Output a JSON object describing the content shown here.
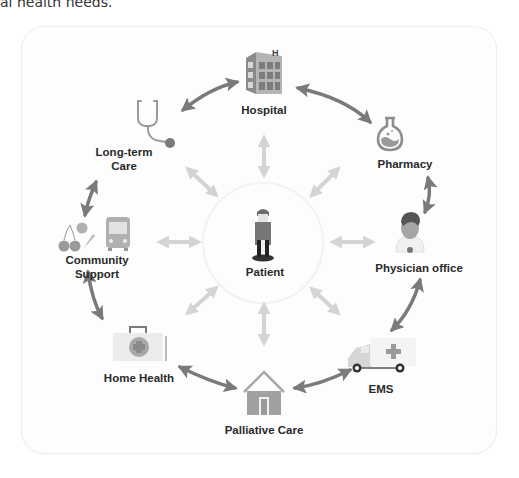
{
  "intro": {
    "text": "al health needs."
  },
  "diagram": {
    "center": {
      "label": "Patient",
      "icon": "patient-icon"
    },
    "nodes": [
      {
        "id": "hospital",
        "label": "Hospital",
        "icon": "hospital-building-icon"
      },
      {
        "id": "pharmacy",
        "label": "Pharmacy",
        "icon": "flask-icon"
      },
      {
        "id": "physician",
        "label": "Physician office",
        "icon": "doctor-icon"
      },
      {
        "id": "ems",
        "label": "EMS",
        "icon": "ambulance-icon"
      },
      {
        "id": "palliative",
        "label": "Palliative Care",
        "icon": "house-icon"
      },
      {
        "id": "home_health",
        "label": "Home Health",
        "icon": "medical-kit-icon"
      },
      {
        "id": "community",
        "label_line1": "Community",
        "label_line2": "Support",
        "icon": "bus-and-food-icon"
      },
      {
        "id": "long_term",
        "label_line1": "Long-term",
        "label_line2": "Care",
        "icon": "stethoscope-icon"
      }
    ],
    "colors": {
      "outer_arrow": "#7a7a7a",
      "inner_arrow": "#d4d4d4",
      "icon": "#9a9a9a",
      "label": "#2a2a2a"
    }
  }
}
